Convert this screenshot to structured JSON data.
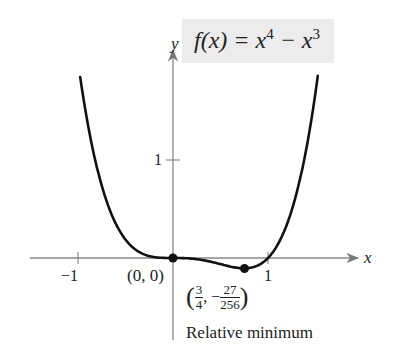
{
  "chart_data": {
    "type": "line",
    "function": "x^4 - x^3",
    "xlabel": "x",
    "ylabel": "y",
    "x_ticks": [
      -1,
      1
    ],
    "x_tick_labels": [
      "−1",
      "1"
    ],
    "y_ticks": [
      1
    ],
    "y_tick_labels": [
      "1"
    ],
    "xlim": [
      -1.5,
      2.0
    ],
    "ylim": [
      -0.3,
      1.9
    ],
    "grid": false,
    "series": [
      {
        "name": "f(x) = x^4 − x^3",
        "x": [
          -0.98,
          -0.75,
          -0.5,
          -0.25,
          0,
          0.25,
          0.5,
          0.75,
          1.0,
          1.2,
          1.53
        ],
        "y": [
          1.86,
          0.74,
          0.19,
          0.02,
          0,
          -0.01,
          -0.06,
          -0.105,
          0,
          0.35,
          1.9
        ]
      }
    ],
    "points": [
      {
        "x": 0,
        "y": 0,
        "label": "(0, 0)"
      },
      {
        "x": 0.75,
        "y": -0.105,
        "label": "(3/4, −27/256)",
        "annotation": "Relative minimum"
      }
    ]
  },
  "labels": {
    "title_prefix": "f(x) = x",
    "title_exp1": "4",
    "title_mid": " − x",
    "title_exp2": "3",
    "y_axis": "y",
    "x_axis": "x",
    "tick_neg1": "−1",
    "tick_pos1": "1",
    "tick_y1": "1",
    "origin_point": "(0, 0)",
    "min_x_num": "3",
    "min_x_den": "4",
    "min_y_num": "27",
    "min_y_den": "256",
    "annotation": "Relative minimum"
  }
}
